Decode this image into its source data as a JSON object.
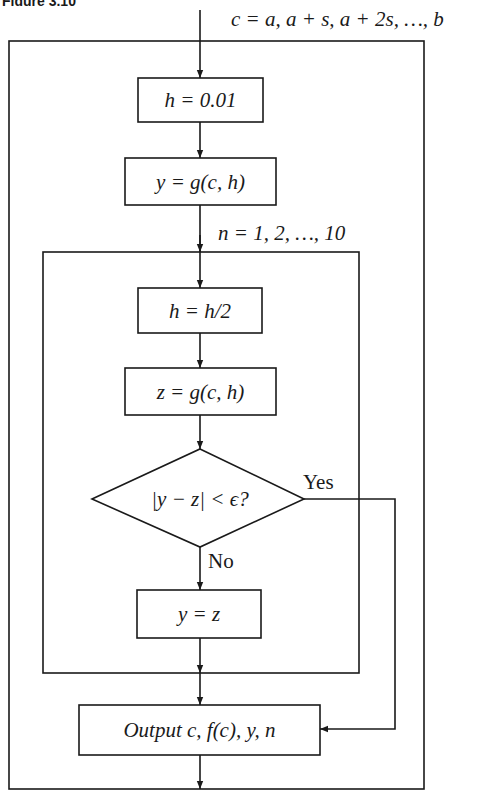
{
  "figure": {
    "caption_partial": "Figure 3.10",
    "outer_loop_label": "c = a, a + s, a + 2s, …, b",
    "inner_loop_label": "n = 1, 2, …, 10",
    "steps": {
      "init_h": "h = 0.01",
      "init_y": "y = g(c, h)",
      "halve_h": "h = h/2",
      "compute_z": "z = g(c, h)",
      "decision": "|y − z| < ϵ?",
      "update_y": "y = z",
      "output": "Output c, f(c), y, n"
    },
    "branch_labels": {
      "yes": "Yes",
      "no": "No"
    },
    "colors": {
      "line": "#1a1a1a",
      "background": "#ffffff"
    }
  }
}
